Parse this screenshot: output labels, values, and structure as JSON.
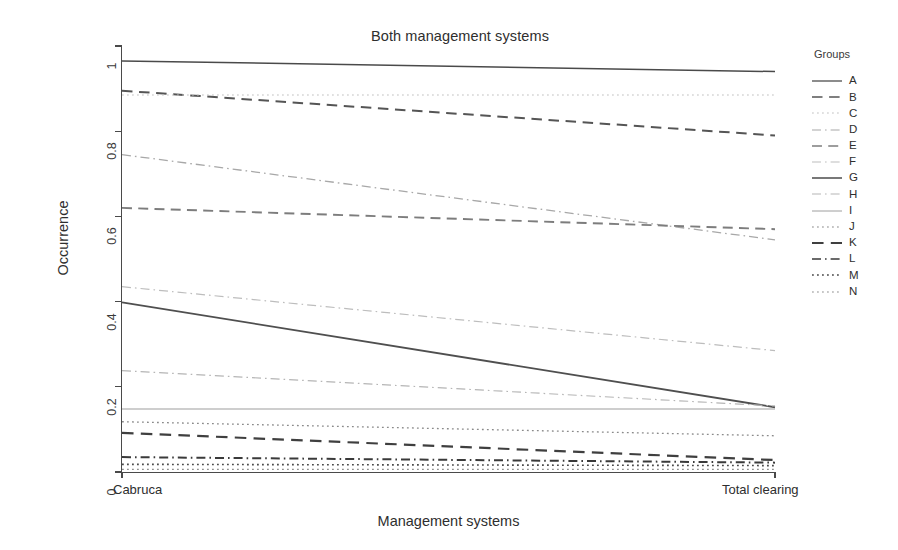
{
  "chart_data": {
    "type": "line",
    "title": "Both management systems",
    "xlabel": "Management systems",
    "ylabel": "Occurrence",
    "x": [
      "Cabruca",
      "Total clearing"
    ],
    "x_tick_labels": [
      "Cabruca",
      "Total clearing"
    ],
    "y_tick_labels": [
      "0",
      "0.2",
      "0.4",
      "0.6",
      "0.8",
      "1"
    ],
    "y_ticks": [
      0,
      0.2,
      0.4,
      0.6,
      0.8,
      1
    ],
    "ylim": [
      0,
      1
    ],
    "xlim": [
      0,
      1
    ],
    "grid": false,
    "legend_position": "right",
    "legend_title": "Groups",
    "series": [
      {
        "name": "A",
        "values": [
          0.965,
          0.94
        ],
        "style": "solid",
        "color": "#4a4a4a",
        "width": 1.5
      },
      {
        "name": "B",
        "values": [
          0.895,
          0.79
        ],
        "style": "dashed",
        "color": "#555555",
        "width": 2.0
      },
      {
        "name": "C",
        "values": [
          0.885,
          0.885
        ],
        "style": "fine-dotted",
        "color": "#c2c2c2",
        "width": 1.1
      },
      {
        "name": "D",
        "values": [
          0.745,
          0.545
        ],
        "style": "dash-dot",
        "color": "#a8a8a8",
        "width": 1.3
      },
      {
        "name": "E",
        "values": [
          0.62,
          0.57
        ],
        "style": "dashed",
        "color": "#7d7d7d",
        "width": 1.9
      },
      {
        "name": "F",
        "values": [
          0.435,
          0.285
        ],
        "style": "dash-dot",
        "color": "#bdbdbd",
        "width": 1.2
      },
      {
        "name": "G",
        "values": [
          0.398,
          0.152
        ],
        "style": "solid",
        "color": "#4f4f4f",
        "width": 1.8
      },
      {
        "name": "H",
        "values": [
          0.238,
          0.155
        ],
        "style": "dash-dot",
        "color": "#b5b5b5",
        "width": 1.2
      },
      {
        "name": "I",
        "values": [
          0.148,
          0.148
        ],
        "style": "solid",
        "color": "#9e9e9e",
        "width": 1.1
      },
      {
        "name": "J",
        "values": [
          0.118,
          0.085
        ],
        "style": "fine-dotted",
        "color": "#8a8a8a",
        "width": 1.3
      },
      {
        "name": "K",
        "values": [
          0.092,
          0.028
        ],
        "style": "dashed",
        "color": "#3f3f3f",
        "width": 2.2
      },
      {
        "name": "L",
        "values": [
          0.035,
          0.022
        ],
        "style": "dash-dot",
        "color": "#3a3a3a",
        "width": 2.0
      },
      {
        "name": "M",
        "values": [
          0.018,
          0.015
        ],
        "style": "fine-dotted",
        "color": "#4a4a4a",
        "width": 1.6
      },
      {
        "name": "N",
        "values": [
          0.006,
          0.006
        ],
        "style": "fine-dotted",
        "color": "#8f8f8f",
        "width": 1.2
      }
    ]
  },
  "legend": {
    "title": "Groups",
    "items": [
      {
        "label": "A"
      },
      {
        "label": "B"
      },
      {
        "label": "C"
      },
      {
        "label": "D"
      },
      {
        "label": "E"
      },
      {
        "label": "F"
      },
      {
        "label": "G"
      },
      {
        "label": "H"
      },
      {
        "label": "I"
      },
      {
        "label": "J"
      },
      {
        "label": "K"
      },
      {
        "label": "L"
      },
      {
        "label": "M"
      },
      {
        "label": "N"
      }
    ]
  },
  "axes": {
    "title": "Both management systems",
    "y_label": "Occurrence",
    "x_label": "Management systems",
    "y_ticks": [
      "1",
      "0.8",
      "0.6",
      "0.4",
      "0.2",
      "0"
    ],
    "x_left_label": "Cabruca",
    "x_right_label": "Total clearing"
  }
}
